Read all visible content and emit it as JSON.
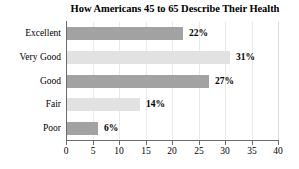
{
  "chart_data": {
    "type": "bar",
    "orientation": "horizontal",
    "title": "How Americans 45 to 65 Describe Their Health",
    "xlabel": "",
    "ylabel": "",
    "xlim": [
      0,
      40
    ],
    "xticks": [
      0,
      5,
      10,
      15,
      20,
      25,
      30,
      35,
      40
    ],
    "xtick_labels": [
      "0",
      "5",
      "10",
      "15",
      "20",
      "25",
      "30",
      "35",
      "40"
    ],
    "grid": true,
    "grid_axis": "x",
    "legend": false,
    "value_suffix": "%",
    "categories": [
      "Excellent",
      "Very Good",
      "Good",
      "Fair",
      "Poor"
    ],
    "values": [
      22,
      31,
      27,
      14,
      6
    ],
    "data_labels": [
      "22%",
      "31%",
      "27%",
      "14%",
      "6%"
    ],
    "bar_colors": [
      "#a2a2a2",
      "#e2e2e2",
      "#a2a2a2",
      "#e2e2e2",
      "#a2a2a2"
    ],
    "bar_shades": [
      "shade-dark",
      "shade-light",
      "shade-dark",
      "shade-light",
      "shade-dark"
    ],
    "axis_color": "#6b6b6b",
    "grid_color": "#e9e9e9",
    "text_color": "#000000",
    "background_color": "#ffffff"
  }
}
